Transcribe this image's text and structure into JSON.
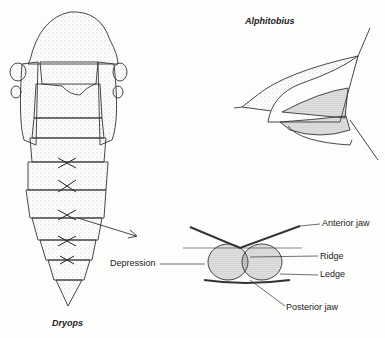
{
  "figure": {
    "specimens": {
      "left": "Dryops",
      "right": "Alphitobius"
    },
    "detail_labels": {
      "anterior_jaw": "Anterior jaw",
      "ridge": "Ridge",
      "ledge": "Ledge",
      "posterior_jaw": "Posterior jaw",
      "depression": "Depression"
    },
    "colors": {
      "ink": "#333333",
      "stipple": "#9a9a9a",
      "background": "#fdfdfb"
    }
  }
}
